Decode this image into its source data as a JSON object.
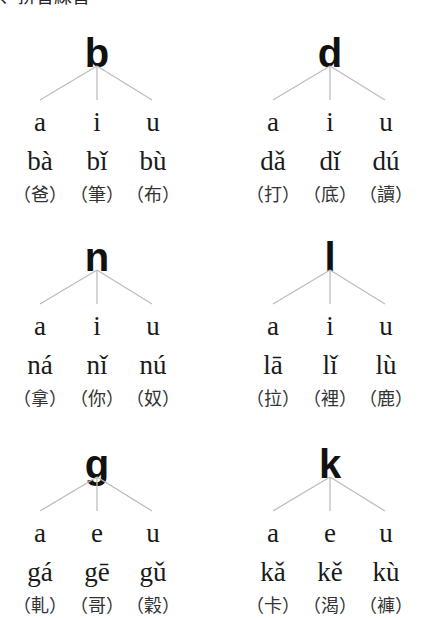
{
  "header": {
    "title": "、拼音練習"
  },
  "blocks": [
    {
      "consonant": "b",
      "vowels": [
        "a",
        "i",
        "u"
      ],
      "syllables": [
        "bà",
        "bǐ",
        "bù"
      ],
      "hanzi": [
        "（爸）",
        "（筆）",
        "（布）"
      ]
    },
    {
      "consonant": "d",
      "vowels": [
        "a",
        "i",
        "u"
      ],
      "syllables": [
        "dǎ",
        "dǐ",
        "dú"
      ],
      "hanzi": [
        "（打）",
        "（底）",
        "（讀）"
      ]
    },
    {
      "consonant": "n",
      "vowels": [
        "a",
        "i",
        "u"
      ],
      "syllables": [
        "ná",
        "nǐ",
        "nú"
      ],
      "hanzi": [
        "（拿）",
        "（你）",
        "（奴）"
      ]
    },
    {
      "consonant": "l",
      "vowels": [
        "a",
        "i",
        "u"
      ],
      "syllables": [
        "lā",
        "lǐ",
        "lù"
      ],
      "hanzi": [
        "（拉）",
        "（裡）",
        "（鹿）"
      ]
    },
    {
      "consonant": "g",
      "vowels": [
        "a",
        "e",
        "u"
      ],
      "syllables": [
        "gá",
        "gē",
        "gǔ"
      ],
      "hanzi": [
        "（軋）",
        "（哥）",
        "（穀）"
      ]
    },
    {
      "consonant": "k",
      "vowels": [
        "a",
        "e",
        "u"
      ],
      "syllables": [
        "kǎ",
        "kě",
        "kù"
      ],
      "hanzi": [
        "（卡）",
        "（渴）",
        "（褲）"
      ]
    }
  ],
  "colors": {
    "tree_line": "#bdbdbd",
    "text": "#1a1a1a"
  }
}
